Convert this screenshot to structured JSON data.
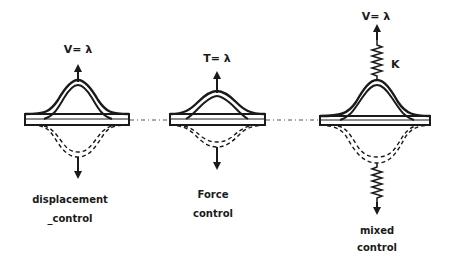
{
  "diagram": {
    "type": "structural loading modes",
    "colors": {
      "ink": "#1a1a1a",
      "background": "#ffffff"
    },
    "panels": [
      {
        "id": "displacement",
        "top_label": "V= λ",
        "caption_line1": "displacement",
        "caption_line2": "_control",
        "has_spring": false
      },
      {
        "id": "force",
        "top_label": "T= λ",
        "caption_line1": "Force",
        "caption_line2": "control",
        "has_spring": false
      },
      {
        "id": "mixed",
        "top_label": "V= λ",
        "spring_label": "K",
        "caption_line1": "mixed",
        "caption_line2": "control",
        "has_spring": true
      }
    ]
  }
}
